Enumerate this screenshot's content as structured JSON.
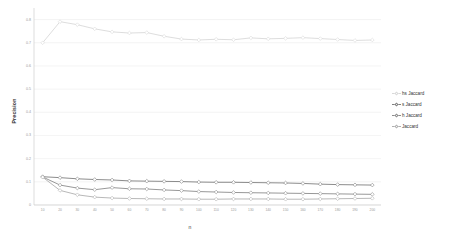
{
  "chart_data": {
    "type": "line",
    "title": "",
    "xlabel": "n",
    "ylabel": "Precision",
    "xlim": [
      5,
      205
    ],
    "ylim": [
      0,
      0.85
    ],
    "grid": true,
    "grid_axis": "y",
    "legend_position": "right",
    "x": [
      10,
      20,
      30,
      40,
      50,
      60,
      70,
      80,
      90,
      100,
      110,
      120,
      130,
      140,
      150,
      160,
      170,
      180,
      190,
      200
    ],
    "xticks": [
      "10",
      "20",
      "30",
      "40",
      "50",
      "60",
      "70",
      "80",
      "90",
      "100",
      "110",
      "120",
      "130",
      "140",
      "150",
      "160",
      "170",
      "180",
      "190",
      "200"
    ],
    "yticks": [
      "0",
      "0.1",
      "0.2",
      "0.3",
      "0.4",
      "0.5",
      "0.6",
      "0.7",
      "0.8"
    ],
    "ytick_values": [
      0,
      0.1,
      0.2,
      0.3,
      0.4,
      0.5,
      0.6,
      0.7,
      0.8
    ],
    "series": [
      {
        "name": "hs Jaccard",
        "color": "#d9d9d9",
        "marker": "diamond",
        "values": [
          0.7,
          0.791,
          0.778,
          0.76,
          0.747,
          0.742,
          0.744,
          0.728,
          0.716,
          0.712,
          0.715,
          0.713,
          0.721,
          0.717,
          0.719,
          0.722,
          0.718,
          0.714,
          0.71,
          0.712
        ]
      },
      {
        "name": "s Jaccard",
        "color": "#7f7f7f",
        "marker": "diamond",
        "values": [
          0.122,
          0.118,
          0.113,
          0.11,
          0.108,
          0.104,
          0.103,
          0.102,
          0.101,
          0.099,
          0.098,
          0.098,
          0.097,
          0.096,
          0.095,
          0.093,
          0.09,
          0.088,
          0.087,
          0.086
        ]
      },
      {
        "name": "h Jaccard",
        "color": "#8c8c8c",
        "marker": "diamond",
        "values": [
          0.121,
          0.086,
          0.073,
          0.066,
          0.075,
          0.07,
          0.069,
          0.065,
          0.062,
          0.058,
          0.056,
          0.054,
          0.053,
          0.052,
          0.051,
          0.05,
          0.049,
          0.048,
          0.047,
          0.046
        ]
      },
      {
        "name": "Jaccard",
        "color": "#b0b0b0",
        "marker": "diamond",
        "values": [
          0.12,
          0.063,
          0.044,
          0.034,
          0.03,
          0.028,
          0.027,
          0.026,
          0.026,
          0.025,
          0.025,
          0.026,
          0.026,
          0.026,
          0.025,
          0.025,
          0.026,
          0.027,
          0.028,
          0.029
        ]
      }
    ]
  },
  "legend": {
    "items": [
      {
        "label": "hs Jaccard"
      },
      {
        "label": "s Jaccard"
      },
      {
        "label": "h Jaccard"
      },
      {
        "label": "Jaccard"
      }
    ]
  },
  "axes": {
    "y_title": "Precision",
    "x_title": "n"
  }
}
